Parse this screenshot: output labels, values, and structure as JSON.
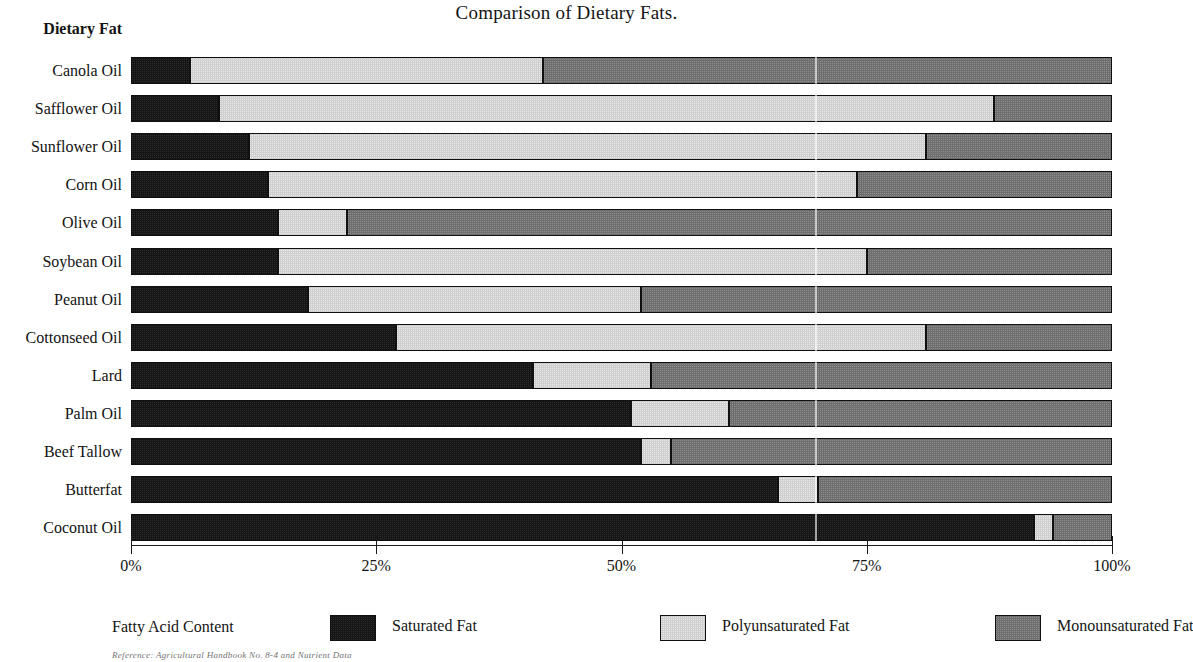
{
  "chart_data": {
    "type": "bar",
    "orientation": "horizontal",
    "stacked": true,
    "normalized": true,
    "title": "Comparison of Dietary Fats.",
    "xlabel": "",
    "ylabel": "Dietary Fat",
    "xlim": [
      0,
      100
    ],
    "x_tick_labels": [
      "0%",
      "25%",
      "50%",
      "75%",
      "100%"
    ],
    "x_tick_values": [
      0,
      25,
      50,
      75,
      100
    ],
    "grid": false,
    "legend_position": "bottom",
    "legend_title": "Fatty Acid Content",
    "categories": [
      "Canola Oil",
      "Safflower Oil",
      "Sunflower Oil",
      "Corn Oil",
      "Olive Oil",
      "Soybean Oil",
      "Peanut Oil",
      "Cottonseed Oil",
      "Lard",
      "Palm Oil",
      "Beef Tallow",
      "Butterfat",
      "Coconut Oil"
    ],
    "series": [
      {
        "name": "Saturated Fat",
        "color": "#151515",
        "values": [
          6,
          9,
          12,
          14,
          15,
          15,
          18,
          27,
          41,
          51,
          52,
          66,
          92
        ]
      },
      {
        "name": "Polyunsaturated Fat",
        "color": "#cfcfcf",
        "values": [
          36,
          79,
          69,
          60,
          7,
          60,
          34,
          54,
          12,
          10,
          3,
          4,
          2
        ]
      },
      {
        "name": "Monounsaturated Fat",
        "color": "#6e6e6e",
        "values": [
          58,
          12,
          19,
          26,
          78,
          25,
          48,
          19,
          47,
          39,
          45,
          30,
          6
        ]
      }
    ],
    "cumulative_boundaries": {
      "Canola Oil": [
        6,
        42,
        100
      ],
      "Safflower Oil": [
        9,
        88,
        100
      ],
      "Sunflower Oil": [
        12,
        81,
        100
      ],
      "Corn Oil": [
        14,
        74,
        100
      ],
      "Olive Oil": [
        15,
        22,
        100
      ],
      "Soybean Oil": [
        15,
        75,
        100
      ],
      "Peanut Oil": [
        18,
        52,
        100
      ],
      "Cottonseed Oil": [
        27,
        81,
        100
      ],
      "Lard": [
        41,
        53,
        100
      ],
      "Palm Oil": [
        51,
        61,
        100
      ],
      "Beef Tallow": [
        52,
        55,
        100
      ],
      "Butterfat": [
        66,
        70,
        100
      ],
      "Coconut Oil": [
        92,
        94,
        100
      ]
    }
  },
  "legend": {
    "title": "Fatty Acid Content",
    "items": [
      {
        "label": "Saturated Fat",
        "color": "#151515",
        "swatch": "saturated-swatch"
      },
      {
        "label": "Polyunsaturated Fat",
        "color": "#cfcfcf",
        "swatch": "polyunsaturated-swatch"
      },
      {
        "label": "Monounsaturated Fat",
        "color": "#6e6e6e",
        "swatch": "monounsaturated-swatch"
      }
    ]
  },
  "footnote": "Reference: Agricultural Handbook No. 8-4 and Nutrient Data"
}
